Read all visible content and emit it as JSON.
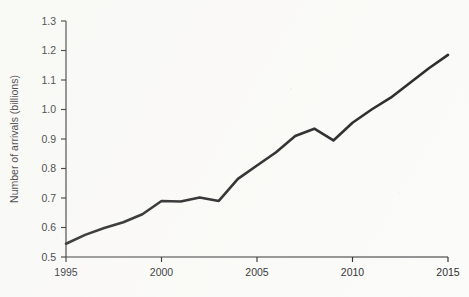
{
  "chart_data": {
    "type": "line",
    "title": "",
    "xlabel": "",
    "ylabel": "Number of arrivals (billions)",
    "xlim": [
      1995,
      2015
    ],
    "ylim": [
      0.5,
      1.3
    ],
    "grid": false,
    "legend": null,
    "x_ticks": [
      "1995",
      "2000",
      "2005",
      "2010",
      "2015"
    ],
    "x_tick_values": [
      1995,
      2000,
      2005,
      2010,
      2015
    ],
    "y_ticks": [
      "0.5",
      "0.6",
      "0.7",
      "0.8",
      "0.9",
      "1.0",
      "1.1",
      "1.2",
      "1.3"
    ],
    "y_tick_values": [
      0.5,
      0.6,
      0.7,
      0.8,
      0.9,
      1.0,
      1.1,
      1.2,
      1.3
    ],
    "x": [
      1995,
      1996,
      1997,
      1998,
      1999,
      2000,
      2001,
      2002,
      2003,
      2004,
      2005,
      2006,
      2007,
      2008,
      2009,
      2010,
      2011,
      2012,
      2013,
      2014,
      2015
    ],
    "series": [
      {
        "name": "International tourist arrivals",
        "values": [
          0.545,
          0.575,
          0.598,
          0.618,
          0.645,
          0.69,
          0.688,
          0.702,
          0.69,
          0.765,
          0.81,
          0.855,
          0.91,
          0.935,
          0.895,
          0.955,
          1.0,
          1.04,
          1.09,
          1.14,
          1.185
        ]
      }
    ]
  },
  "axes": {
    "y_axis_title": "Number of arrivals (billions)"
  }
}
